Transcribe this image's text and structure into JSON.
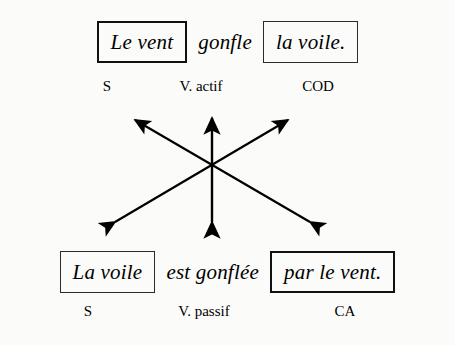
{
  "diagram": {
    "background_color": "#fbfbfa",
    "ink_color": "#000000",
    "active_sentence": {
      "subject": "Le vent",
      "verb": "gonfle",
      "object": "la voile."
    },
    "passive_sentence": {
      "subject": "La voile",
      "verb": "est gonflée",
      "agent": "par le vent."
    },
    "active_labels": {
      "subject": "S",
      "verb": "V. actif",
      "object": "COD"
    },
    "passive_labels": {
      "subject": "S",
      "verb": "V. passif",
      "agent": "CA"
    },
    "arrows": [
      {
        "name": "cod-to-subject",
        "from": [
          310,
          222
        ],
        "to": [
          135,
          120
        ],
        "double_headed": true
      },
      {
        "name": "subject-to-agent",
        "from": [
          115,
          222
        ],
        "to": [
          288,
          120
        ],
        "double_headed": true
      },
      {
        "name": "verb-to-verb",
        "from": [
          212,
          222
        ],
        "to": [
          212,
          118
        ],
        "double_headed": true
      }
    ]
  }
}
